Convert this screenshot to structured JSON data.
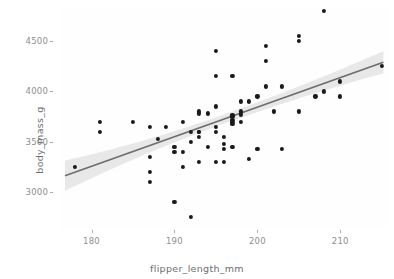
{
  "chart_data": {
    "type": "scatter",
    "title": "",
    "subtitle": "",
    "xlabel": "flipper_length_mm",
    "ylabel": "body_mass_g",
    "xlim": [
      176.2,
      216.0
    ],
    "ylim": [
      2620,
      4830
    ],
    "xticks": [
      180,
      190,
      200,
      210
    ],
    "yticks": [
      3000,
      3500,
      4000,
      4500
    ],
    "xtick_labels": [
      "180",
      "190",
      "200",
      "210"
    ],
    "ytick_labels": [
      "3000",
      "3500",
      "4000",
      "4500"
    ],
    "grid": false,
    "legend": "none",
    "point_color": "#1a1a1a",
    "line_color": "#6d6d6d",
    "ribbon_color": "#d6d6d6",
    "panel_background": "#fefefe",
    "figure_background": "#ffffff",
    "axis_text_color": "#8e8e8e",
    "axis_title_color": "#6e6e6e",
    "smooth": {
      "method": "lm",
      "se": true,
      "x_start": 176.8,
      "x_end": 215.2,
      "y_start": 3160,
      "y_end": 4290,
      "se_start": 150,
      "se_end": 110,
      "se_min": 46
    },
    "x": [
      178.0,
      181.0,
      181.0,
      185.0,
      187.0,
      187.0,
      187.0,
      187.0,
      188.0,
      189.0,
      190.0,
      190.0,
      190.0,
      191.0,
      191.0,
      191.0,
      192.0,
      192.0,
      192.0,
      193.0,
      193.0,
      193.0,
      193.0,
      193.0,
      193.0,
      194.0,
      194.0,
      195.0,
      195.0,
      195.0,
      195.0,
      195.0,
      195.0,
      196.0,
      196.0,
      196.0,
      196.0,
      197.0,
      197.0,
      197.0,
      197.0,
      197.0,
      197.0,
      197.0,
      198.0,
      198.0,
      198.0,
      198.0,
      199.0,
      199.0,
      200.0,
      200.0,
      201.0,
      201.0,
      201.0,
      202.0,
      203.0,
      203.0,
      205.0,
      205.0,
      205.0,
      207.0,
      208.0,
      208.0,
      210.0,
      210.0,
      215.0
    ],
    "y": [
      3250,
      3700,
      3600,
      3700,
      3650,
      3350,
      3200,
      3100,
      3525,
      3650,
      3450,
      3400,
      2900,
      3700,
      3400,
      3250,
      3500,
      3600,
      2750,
      3800,
      3780,
      3600,
      3550,
      3300,
      3600,
      3780,
      3450,
      4400,
      4150,
      3850,
      3650,
      3600,
      3300,
      3550,
      3475,
      3430,
      3300,
      3760,
      3750,
      3720,
      3700,
      3680,
      3450,
      4150,
      3900,
      3800,
      3770,
      3700,
      3900,
      3325,
      3950,
      3425,
      4450,
      4300,
      4050,
      3800,
      4050,
      3425,
      4550,
      4500,
      3800,
      3950,
      4000,
      4800,
      4100,
      3950,
      4250
    ]
  },
  "axes": {
    "x_title": "flipper_length_mm",
    "y_title": "body_mass_g"
  }
}
